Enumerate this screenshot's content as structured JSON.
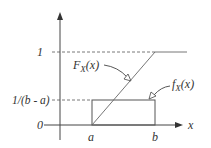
{
  "diagram": {
    "y_ticks": [
      {
        "label": "1",
        "y": 52
      },
      {
        "label": "1/(b - a)",
        "y": 100
      },
      {
        "label": "0",
        "y": 125
      }
    ],
    "x_ticks": [
      {
        "label": "a",
        "x": 92
      },
      {
        "label": "b",
        "x": 155
      }
    ],
    "x_axis_label": "x",
    "curves": {
      "cdf_label": "F",
      "cdf_sub": "X",
      "cdf_arg": "(x)",
      "pdf_label": "f",
      "pdf_sub": "X",
      "pdf_arg": "(x)"
    },
    "colors": {
      "line": "#555555",
      "text": "#333333"
    }
  }
}
